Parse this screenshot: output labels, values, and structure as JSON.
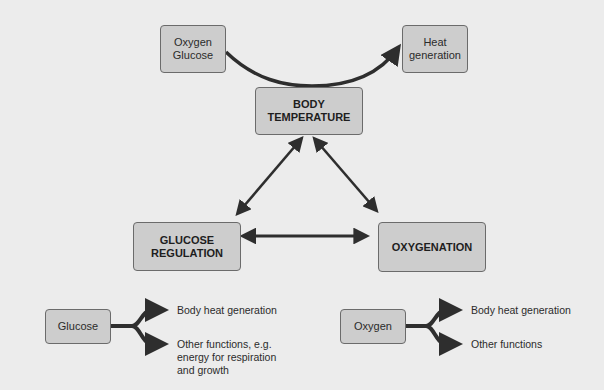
{
  "diagram": {
    "top": {
      "inputs_box": "Oxygen\nGlucose",
      "output_box": "Heat\ngeneration"
    },
    "nodes": {
      "body_temperature": "BODY\nTEMPERATURE",
      "glucose_regulation": "GLUCOSE\nREGULATION",
      "oxygenation": "OXYGENATION"
    },
    "glucose_fork": {
      "source": "Glucose",
      "outputs": [
        "Body heat generation",
        "Other functions, e.g.\nenergy for respiration\nand growth"
      ]
    },
    "oxygen_fork": {
      "source": "Oxygen",
      "outputs": [
        "Body heat generation",
        "Other functions"
      ]
    },
    "edges": [
      {
        "from": "Oxygen Glucose",
        "to": "Heat generation",
        "type": "curved-arrow"
      },
      {
        "from": "BODY TEMPERATURE",
        "to": "GLUCOSE REGULATION",
        "type": "bidirectional"
      },
      {
        "from": "BODY TEMPERATURE",
        "to": "OXYGENATION",
        "type": "bidirectional"
      },
      {
        "from": "GLUCOSE REGULATION",
        "to": "OXYGENATION",
        "type": "bidirectional"
      }
    ],
    "colors": {
      "background": "#ececec",
      "box_fill": "#cdcdcd",
      "box_border": "#6b6b6b",
      "arrow": "#2e2e2e"
    }
  }
}
